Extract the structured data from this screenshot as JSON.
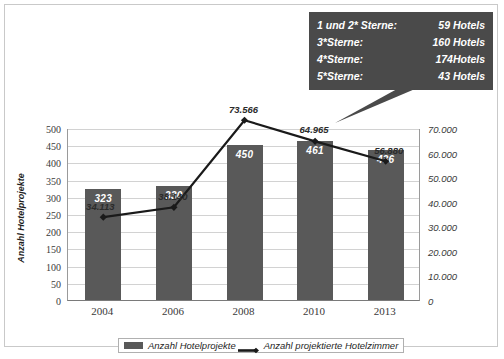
{
  "chart_data": {
    "type": "bar",
    "title": "",
    "subtitle": "",
    "categories": [
      "2004",
      "2006",
      "2008",
      "2010",
      "2013"
    ],
    "series": [
      {
        "name": "Anzahl Hotelprojekte",
        "type": "bar",
        "axis": "left",
        "values": [
          323,
          330,
          450,
          461,
          436
        ],
        "labels": [
          "323",
          "330",
          "450",
          "461",
          "436"
        ],
        "color": "#595959"
      },
      {
        "name": "Anzahl projektierte Hotelzimmer",
        "type": "line",
        "axis": "right",
        "values": [
          34113,
          38140,
          73566,
          64965,
          56880
        ],
        "labels": [
          "34.113",
          "38.140",
          "73.566",
          "64.965",
          "56.880"
        ],
        "color": "#1a1a1a",
        "marker": "diamond"
      }
    ],
    "xlabel": "",
    "ylabel": "Anzahl Hotelprojekte",
    "y2label": "Anzahl projektierte Hotelzimmer",
    "ylim": [
      0,
      500
    ],
    "y2lim": [
      0,
      70000
    ],
    "yticks": [
      "0",
      "50",
      "100",
      "150",
      "200",
      "250",
      "300",
      "350",
      "400",
      "450",
      "500"
    ],
    "y2ticks": [
      "0",
      "10.000",
      "20.000",
      "30.000",
      "40.000",
      "50.000",
      "60.000",
      "70.000"
    ],
    "grid": true,
    "legend_position": "bottom"
  },
  "callout": {
    "rows": [
      {
        "category": "1 und 2* Sterne:",
        "value": "59 Hotels"
      },
      {
        "category": "3*Sterne:",
        "value": "160 Hotels"
      },
      {
        "category": "4*Sterne:",
        "value": "174Hotels"
      },
      {
        "category": "5*Sterne:",
        "value": "43 Hotels"
      }
    ],
    "background": "#4a4a4a"
  },
  "legend": {
    "items": [
      {
        "label": "Anzahl Hotelprojekte",
        "marker": "bar-swatch"
      },
      {
        "label": "Anzahl projektierte Hotelzimmer",
        "marker": "line-marker"
      }
    ]
  }
}
